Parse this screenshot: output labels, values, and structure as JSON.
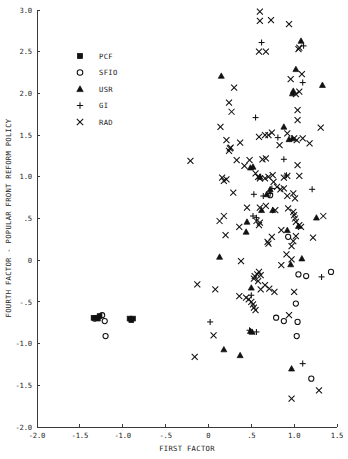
{
  "chart_data": {
    "type": "scatter",
    "title": "",
    "xlabel": "FIRST FACTOR",
    "ylabel": "FOURTH FACTOR - POPULAR FRONT REFORM POLICY",
    "xlim": [
      -2.0,
      1.5
    ],
    "ylim": [
      -2.0,
      3.0
    ],
    "xticks": [
      -2.0,
      -1.5,
      -1.0,
      -0.5,
      0,
      0.5,
      1.0,
      1.5
    ],
    "xticklabels": [
      "-2.0",
      "-1.5",
      "-1.0",
      "-.5",
      "0",
      ".5",
      "1.0",
      "1.5"
    ],
    "yticks": [
      -2.0,
      -1.5,
      -1.0,
      -0.5,
      0,
      0.5,
      1.0,
      1.5,
      2.0,
      2.5,
      3.0
    ],
    "yticklabels": [
      "-2.0",
      "-1.5",
      "-1.0",
      "-.5",
      "0",
      ".5",
      "1.0",
      "1.5",
      "2.0",
      "2.5",
      "3.0"
    ],
    "grid": false,
    "legend_position": "upper-left",
    "series": [
      {
        "name": "PCF",
        "marker": "square",
        "points": [
          [
            -1.34,
            -0.69
          ],
          [
            -1.31,
            -0.69
          ],
          [
            -1.29,
            -0.7
          ],
          [
            -1.27,
            -0.67
          ],
          [
            -0.92,
            -0.7
          ],
          [
            -0.9,
            -0.72
          ],
          [
            -0.88,
            -0.7
          ]
        ]
      },
      {
        "name": "SFIO",
        "marker": "circle",
        "points": [
          [
            -1.24,
            -0.66
          ],
          [
            -1.21,
            -0.73
          ],
          [
            -1.33,
            -0.7
          ],
          [
            -1.2,
            -0.91
          ],
          [
            0.72,
            0.78
          ],
          [
            0.93,
            0.28
          ],
          [
            1.05,
            -0.17
          ],
          [
            1.14,
            -0.19
          ],
          [
            1.43,
            -0.14
          ],
          [
            1.02,
            -0.52
          ],
          [
            0.88,
            -0.73
          ],
          [
            1.04,
            -0.74
          ],
          [
            1.03,
            -0.91
          ],
          [
            1.2,
            -1.42
          ],
          [
            0.79,
            -0.69
          ]
        ]
      },
      {
        "name": "USR",
        "marker": "triangle",
        "points": [
          [
            0.15,
            2.21
          ],
          [
            1.08,
            2.63
          ],
          [
            1.02,
            2.29
          ],
          [
            0.98,
            2.0
          ],
          [
            0.99,
            2.03
          ],
          [
            0.94,
            1.45
          ],
          [
            0.98,
            1.46
          ],
          [
            1.33,
            2.1
          ],
          [
            0.88,
            1.6
          ],
          [
            0.49,
            1.11
          ],
          [
            0.52,
            1.12
          ],
          [
            1.26,
            0.51
          ],
          [
            0.45,
            0.46
          ],
          [
            0.44,
            0.34
          ],
          [
            0.62,
            0.6
          ],
          [
            0.92,
            0.36
          ],
          [
            1.05,
            0.41
          ],
          [
            1.09,
            0.02
          ],
          [
            0.13,
            0.04
          ],
          [
            0.72,
            0.85
          ],
          [
            0.5,
            -0.33
          ],
          [
            0.49,
            -0.85
          ],
          [
            0.51,
            -0.86
          ],
          [
            0.18,
            -1.07
          ],
          [
            0.37,
            -1.14
          ],
          [
            0.97,
            -1.3
          ],
          [
            0.96,
            -0.05
          ],
          [
            0.75,
            0.6
          ],
          [
            0.68,
            0.79
          ],
          [
            0.6,
            1.0
          ]
        ]
      },
      {
        "name": "GI",
        "marker": "plus",
        "points": [
          [
            0.62,
            2.61
          ],
          [
            1.11,
            2.57
          ],
          [
            1.1,
            2.13
          ],
          [
            0.55,
            1.71
          ],
          [
            0.88,
            1.21
          ],
          [
            0.81,
            1.47
          ],
          [
            1.21,
            0.85
          ],
          [
            0.72,
            0.8
          ],
          [
            0.64,
            0.77
          ],
          [
            0.53,
            0.79
          ],
          [
            0.52,
            0.53
          ],
          [
            0.56,
            0.51
          ],
          [
            1.32,
            -0.2
          ],
          [
            0.48,
            -0.84
          ],
          [
            0.56,
            -0.86
          ],
          [
            0.02,
            -0.74
          ],
          [
            1.1,
            -1.24
          ],
          [
            0.5,
            -0.42
          ],
          [
            0.91,
            1.02
          ],
          [
            0.74,
            0.86
          ]
        ]
      },
      {
        "name": "RAD",
        "marker": "x",
        "points": [
          [
            0.6,
            2.98
          ],
          [
            0.6,
            2.87
          ],
          [
            0.73,
            2.88
          ],
          [
            0.94,
            2.83
          ],
          [
            0.59,
            2.5
          ],
          [
            0.67,
            2.5
          ],
          [
            1.05,
            2.53
          ],
          [
            1.06,
            2.55
          ],
          [
            0.96,
            2.17
          ],
          [
            1.09,
            2.23
          ],
          [
            0.3,
            2.07
          ],
          [
            0.24,
            1.89
          ],
          [
            0.27,
            1.78
          ],
          [
            1.02,
            1.99
          ],
          [
            1.06,
            2.02
          ],
          [
            1.04,
            1.8
          ],
          [
            1.04,
            1.68
          ],
          [
            1.31,
            1.59
          ],
          [
            0.92,
            1.52
          ],
          [
            0.74,
            1.53
          ],
          [
            0.7,
            1.5
          ],
          [
            0.66,
            1.5
          ],
          [
            0.59,
            1.48
          ],
          [
            0.14,
            1.6
          ],
          [
            0.21,
            1.44
          ],
          [
            0.25,
            1.34
          ],
          [
            0.26,
            1.35
          ],
          [
            0.24,
            1.31
          ],
          [
            0.37,
            1.41
          ],
          [
            0.48,
            1.2
          ],
          [
            0.63,
            1.21
          ],
          [
            0.67,
            1.22
          ],
          [
            1.0,
            1.46
          ],
          [
            1.03,
            1.44
          ],
          [
            1.1,
            1.46
          ],
          [
            1.18,
            1.4
          ],
          [
            1.04,
            1.14
          ],
          [
            0.83,
            1.38
          ],
          [
            0.88,
            0.99
          ],
          [
            0.92,
            1.01
          ],
          [
            1.06,
            1.01
          ],
          [
            0.75,
            1.02
          ],
          [
            0.7,
            1.0
          ],
          [
            0.66,
            0.98
          ],
          [
            0.6,
            0.98
          ],
          [
            0.58,
            1.0
          ],
          [
            0.55,
            1.04
          ],
          [
            0.76,
            0.94
          ],
          [
            0.8,
            0.88
          ],
          [
            0.84,
            0.85
          ],
          [
            0.88,
            0.86
          ],
          [
            0.99,
            0.8
          ],
          [
            0.21,
            0.97
          ],
          [
            0.18,
            0.95
          ],
          [
            0.16,
            0.99
          ],
          [
            -0.21,
            1.19
          ],
          [
            0.29,
            0.81
          ],
          [
            0.6,
            0.63
          ],
          [
            0.67,
            0.65
          ],
          [
            0.78,
            0.6
          ],
          [
            0.93,
            0.62
          ],
          [
            0.99,
            0.58
          ],
          [
            1.0,
            0.54
          ],
          [
            1.01,
            0.5
          ],
          [
            1.02,
            0.46
          ],
          [
            1.06,
            0.42
          ],
          [
            1.08,
            0.4
          ],
          [
            1.34,
            0.53
          ],
          [
            0.13,
            0.47
          ],
          [
            0.18,
            0.53
          ],
          [
            0.2,
            0.3
          ],
          [
            0.36,
            0.4
          ],
          [
            0.56,
            0.47
          ],
          [
            0.6,
            0.45
          ],
          [
            0.59,
            0.42
          ],
          [
            0.74,
            0.28
          ],
          [
            0.69,
            0.22
          ],
          [
            0.7,
            0.2
          ],
          [
            0.85,
            0.36
          ],
          [
            1.02,
            0.29
          ],
          [
            1.22,
            0.27
          ],
          [
            0.99,
            0.23
          ],
          [
            0.97,
            0.17
          ],
          [
            0.91,
            0.07
          ],
          [
            0.97,
            0.01
          ],
          [
            0.85,
            -0.06
          ],
          [
            0.38,
            -0.01
          ],
          [
            0.59,
            -0.14
          ],
          [
            0.57,
            -0.17
          ],
          [
            0.61,
            -0.18
          ],
          [
            0.54,
            -0.19
          ],
          [
            0.53,
            -0.22
          ],
          [
            0.58,
            -0.25
          ],
          [
            0.66,
            -0.3
          ],
          [
            0.61,
            -0.35
          ],
          [
            0.71,
            -0.34
          ],
          [
            0.77,
            -0.38
          ],
          [
            1.0,
            -0.38
          ],
          [
            -0.13,
            -0.29
          ],
          [
            0.08,
            -0.35
          ],
          [
            0.36,
            -0.43
          ],
          [
            0.44,
            -0.45
          ],
          [
            0.47,
            -0.47
          ],
          [
            0.5,
            -0.5
          ],
          [
            0.52,
            -0.53
          ],
          [
            0.53,
            -0.57
          ],
          [
            0.55,
            -0.6
          ],
          [
            0.94,
            -0.66
          ],
          [
            -0.16,
            -1.16
          ],
          [
            0.06,
            -0.9
          ],
          [
            1.29,
            -1.56
          ],
          [
            0.97,
            -1.66
          ],
          [
            0.33,
            1.2
          ],
          [
            0.42,
            1.13
          ],
          [
            0.92,
            0.77
          ],
          [
            1.01,
            0.74
          ],
          [
            0.45,
            0.63
          ]
        ]
      }
    ]
  },
  "legend": {
    "entries": [
      {
        "label": "PCF",
        "marker": "square"
      },
      {
        "label": "SFIO",
        "marker": "circle"
      },
      {
        "label": "USR",
        "marker": "triangle"
      },
      {
        "label": "GI",
        "marker": "plus"
      },
      {
        "label": "RAD",
        "marker": "x"
      }
    ]
  },
  "colors": {
    "background": "#ffffff",
    "axis": "#3a3a3a",
    "marker": "#111111",
    "text": "#222222"
  }
}
